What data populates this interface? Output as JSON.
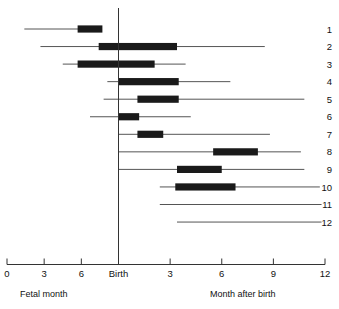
{
  "chart_data": {
    "type": "bar",
    "title": "",
    "subtitle": "",
    "xlabel_left": "Fetal month",
    "xlabel_right": "Month after birth",
    "grid": false,
    "legend": "none",
    "orientation": "horizontal",
    "axis": {
      "birth_label": "Birth",
      "birth_value": 0,
      "left_ticks": [
        {
          "label": "0",
          "value": -9
        },
        {
          "label": "3",
          "value": -6
        },
        {
          "label": "6",
          "value": -3
        }
      ],
      "birth_tick": {
        "label": "Birth",
        "value": 0
      },
      "right_ticks": [
        {
          "label": "3",
          "value": 3
        },
        {
          "label": "6",
          "value": 6
        },
        {
          "label": "9",
          "value": 9
        },
        {
          "label": "12",
          "value": 12
        }
      ],
      "xlim": [
        -9,
        12
      ],
      "units": "months"
    },
    "series_name": "developmental interval",
    "rows": [
      {
        "label": "1",
        "line_start": -7.6,
        "line_end": -1.5,
        "bar_start": -3.3,
        "bar_end": -1.3,
        "has_bar": true
      },
      {
        "label": "2",
        "line_start": -6.3,
        "line_end": 8.5,
        "bar_start": -1.6,
        "bar_end": 3.4,
        "has_bar": true
      },
      {
        "label": "3",
        "line_start": -4.5,
        "line_end": 3.9,
        "bar_start": -3.3,
        "bar_end": 2.1,
        "has_bar": true
      },
      {
        "label": "4",
        "line_start": -0.9,
        "line_end": 6.5,
        "bar_start": 0.0,
        "bar_end": 3.5,
        "has_bar": true
      },
      {
        "label": "5",
        "line_start": -1.2,
        "line_end": 10.8,
        "bar_start": 1.1,
        "bar_end": 3.5,
        "has_bar": true
      },
      {
        "label": "6",
        "line_start": -2.3,
        "line_end": 4.2,
        "bar_start": 0.0,
        "bar_end": 1.2,
        "has_bar": true
      },
      {
        "label": "7",
        "line_start": 0.0,
        "line_end": 8.8,
        "bar_start": 1.1,
        "bar_end": 2.6,
        "has_bar": true
      },
      {
        "label": "8",
        "line_start": 0.0,
        "line_end": 10.6,
        "bar_start": 5.5,
        "bar_end": 8.1,
        "has_bar": true
      },
      {
        "label": "9",
        "line_start": 0.0,
        "line_end": 10.8,
        "bar_start": 3.4,
        "bar_end": 6.0,
        "has_bar": true
      },
      {
        "label": "10",
        "line_start": 2.4,
        "line_end": 11.7,
        "bar_start": 3.3,
        "bar_end": 6.8,
        "has_bar": true
      },
      {
        "label": "11",
        "line_start": 2.4,
        "line_end": 11.8,
        "bar_start": 0,
        "bar_end": 0,
        "has_bar": false
      },
      {
        "label": "12",
        "line_start": 3.4,
        "line_end": 11.8,
        "bar_start": 0,
        "bar_end": 0,
        "has_bar": false
      }
    ],
    "colors": {
      "bar": "#1a1a1a",
      "line": "#555555",
      "axis": "#333333",
      "background": "#ffffff"
    }
  }
}
